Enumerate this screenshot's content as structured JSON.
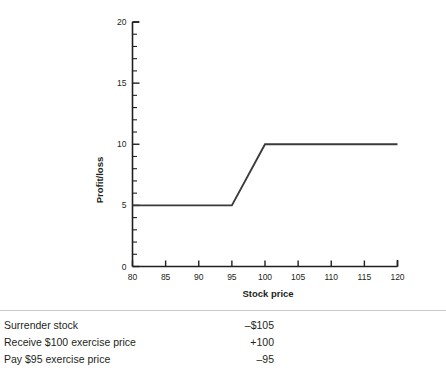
{
  "chart_data": {
    "type": "line",
    "title": "",
    "xlabel": "Stock price",
    "ylabel": "Profit/loss",
    "xlim": [
      80,
      120
    ],
    "ylim": [
      0,
      20
    ],
    "grid": false,
    "legend": "none",
    "x_ticks": [
      80,
      85,
      90,
      95,
      100,
      105,
      110,
      115,
      120
    ],
    "x_tick_labels": [
      "80",
      "85",
      "90",
      "95",
      "100",
      "105",
      "110",
      "115",
      "120"
    ],
    "x_minor_step": 1,
    "y_ticks": [
      0,
      5,
      10,
      15,
      20
    ],
    "y_tick_labels": [
      "0",
      "5",
      "10",
      "15",
      "20"
    ],
    "y_minor_step": 1,
    "series": [
      {
        "name": "Profit/loss payoff",
        "x": [
          80,
          95,
          100,
          120
        ],
        "values": [
          5,
          5,
          10,
          10
        ]
      }
    ]
  },
  "ledger": {
    "rows": [
      {
        "label": "Surrender stock",
        "value": "–$105"
      },
      {
        "label": "Receive $100 exercise price",
        "value": "+100"
      },
      {
        "label": "Pay $95 exercise price",
        "value": "–95"
      }
    ]
  },
  "colors": {
    "ink": "#231f20",
    "data_line": "#3b3b3c",
    "divider": "#c9c9c9",
    "background": "#ffffff"
  }
}
